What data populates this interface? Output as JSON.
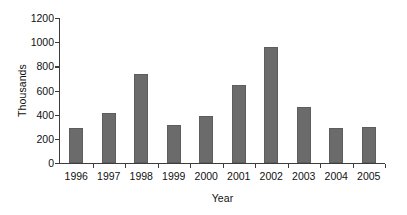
{
  "chart_data": {
    "type": "bar",
    "title": "",
    "subtitle": "",
    "xlabel": "Year",
    "ylabel": "Thousands",
    "categories": [
      "1996",
      "1997",
      "1998",
      "1999",
      "2000",
      "2001",
      "2002",
      "2003",
      "2004",
      "2005"
    ],
    "values": [
      290,
      415,
      740,
      315,
      390,
      645,
      960,
      465,
      290,
      295
    ],
    "series": [
      {
        "name": "",
        "values": [
          290,
          415,
          740,
          315,
          390,
          645,
          960,
          465,
          290,
          295
        ]
      }
    ],
    "ylim": [
      0,
      1200
    ],
    "ytick_labels": [
      "0",
      "200",
      "400",
      "600",
      "800",
      "1000",
      "1200"
    ],
    "ytick_values": [
      0,
      200,
      400,
      600,
      800,
      1000,
      1200
    ],
    "grid": false,
    "legend": false,
    "legend_position": "none",
    "bar_color": "#6b6b6b",
    "axis_color": "#3c3c3c",
    "text_color": "#111111",
    "background_color": "#ffffff"
  }
}
